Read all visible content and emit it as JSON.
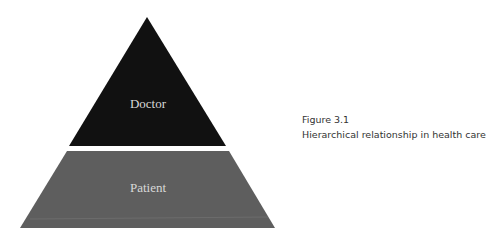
{
  "diagram": {
    "type": "pyramid",
    "tiers": [
      {
        "label": "Doctor",
        "level": "top",
        "color": "#111111"
      },
      {
        "label": "Patient",
        "level": "bottom",
        "color": "#5e5e5e"
      }
    ]
  },
  "caption": {
    "figure_number": "Figure 3.1",
    "title": "Hierarchical relationship in health care"
  }
}
